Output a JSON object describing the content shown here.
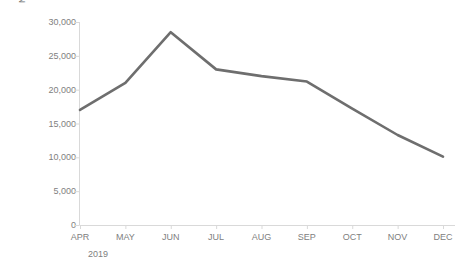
{
  "chart_data": {
    "type": "line",
    "title": "",
    "subtitle": "",
    "xlabel": "",
    "ylabel": "NUMBER OF PROJECT HOURS",
    "group_label": "2019",
    "categories": [
      "APR",
      "MAY",
      "JUN",
      "JUL",
      "AUG",
      "SEP",
      "OCT",
      "NOV",
      "DEC"
    ],
    "values": [
      17000,
      21000,
      28500,
      23000,
      22000,
      21200,
      17200,
      13300,
      10100
    ],
    "series": [
      {
        "name": "Number of Project Hours",
        "values": [
          17000,
          21000,
          28500,
          23000,
          22000,
          21200,
          17200,
          13300,
          10100
        ]
      }
    ],
    "ylim": [
      0,
      30000
    ],
    "ytick_values": [
      0,
      5000,
      10000,
      15000,
      20000,
      25000,
      30000
    ],
    "ytick_labels": [
      "0",
      "5,000",
      "10,000",
      "15,000",
      "20,000",
      "25,000",
      "30,000"
    ],
    "grid": false,
    "legend": false,
    "legend_position": "none",
    "colors": {
      "line": "#6e6e6e",
      "axis": "#d9d9d9",
      "tick_text": "#808080",
      "axis_title": "#6d6d6d",
      "background": "#ffffff"
    },
    "line_width": 2.6
  }
}
